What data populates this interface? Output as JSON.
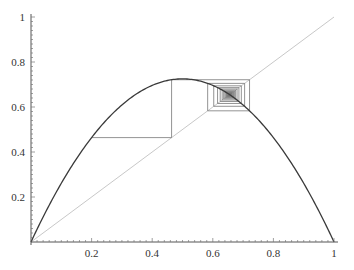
{
  "chart_data": {
    "type": "line",
    "title": "",
    "xlabel": "",
    "ylabel": "",
    "xlim": [
      0,
      1
    ],
    "ylim": [
      0,
      1
    ],
    "grid": false,
    "legend": null,
    "x_ticks": [
      "0.2",
      "0.4",
      "0.6",
      "0.8",
      "1"
    ],
    "y_ticks": [
      "0.2",
      "0.4",
      "0.6",
      "0.8",
      "1"
    ],
    "series": [
      {
        "name": "logistic-map f(x)=r·x·(1−x)",
        "r": 2.9,
        "color": "#3a3a3a",
        "kind": "curve"
      },
      {
        "name": "identity y=x",
        "color": "#c8c8c8",
        "kind": "diagonal"
      },
      {
        "name": "cobweb iteration",
        "x0": 0.2,
        "iterations": 60,
        "color": "#777777",
        "kind": "cobweb"
      }
    ],
    "annotations": [
      "cobweb spirals inward to fixed point ≈ 0.655"
    ]
  },
  "axes": {
    "x_tick_values": [
      0.2,
      0.4,
      0.6,
      0.8,
      1
    ],
    "y_tick_values": [
      0.2,
      0.4,
      0.6,
      0.8,
      1
    ]
  }
}
